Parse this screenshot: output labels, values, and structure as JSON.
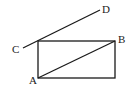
{
  "diagram": {
    "points": {
      "A": {
        "label": "A",
        "x": 38,
        "y": 78,
        "lx": 29,
        "ly": 84
      },
      "B": {
        "label": "B",
        "x": 115,
        "y": 41,
        "lx": 118,
        "ly": 43
      },
      "C": {
        "label": "C",
        "x": 23,
        "y": 48,
        "lx": 12,
        "ly": 53
      },
      "D": {
        "label": "D",
        "x": 100,
        "y": 10,
        "lx": 102,
        "ly": 13
      }
    },
    "rectangle": {
      "x": 38,
      "y": 41,
      "width": 77,
      "height": 37
    },
    "segments": [
      {
        "name": "diagonal-AB",
        "from": "A",
        "to": "B"
      },
      {
        "name": "line-CD",
        "from": "C",
        "to": "D"
      }
    ],
    "stroke_color": "#1a1a1a"
  }
}
